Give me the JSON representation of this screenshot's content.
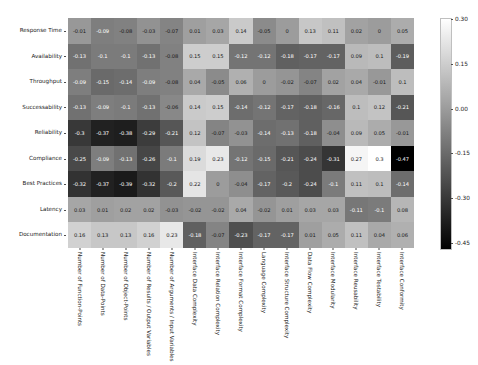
{
  "chart_data": {
    "type": "heatmap",
    "title": "",
    "xlabel": "",
    "ylabel": "",
    "grid": false,
    "legend_position": "right",
    "colormap": "gray",
    "colorbar": {
      "ticks": [
        "0.30",
        "0.15",
        "0.00",
        "-0.15",
        "-0.30",
        "-0.45"
      ],
      "tick_values": [
        0.3,
        0.15,
        0.0,
        -0.15,
        -0.3,
        -0.45
      ],
      "vmin": -0.47,
      "vmax": 0.3
    },
    "row_labels": [
      "Response Time",
      "Availability",
      "Throughput",
      "Successability",
      "Reliability",
      "Compliance",
      "Best Practices",
      "Latency",
      "Documentation"
    ],
    "col_labels": [
      "Number of Function-Points",
      "Number of Data-Points",
      "Number of Object-Points",
      "Number of Results / Output Variables",
      "Number of Arguments / Input Variables",
      "Interface Data Complexity",
      "Interface Relation Complexity",
      "Interface Format Complexity",
      "Language Complexity",
      "Interface Structure Complexity",
      "Data Flow Complexity",
      "Interface Modularity",
      "Interface Reusability",
      "Interface Testability",
      "Interface Conformity"
    ],
    "values": [
      [
        -0.01,
        -0.09,
        -0.08,
        -0.03,
        -0.07,
        0.01,
        0.03,
        0.14,
        -0.05,
        0,
        0.13,
        0.11,
        0.02,
        0,
        0.05
      ],
      [
        -0.13,
        -0.1,
        -0.1,
        -0.13,
        -0.08,
        0.15,
        0.15,
        -0.12,
        -0.12,
        -0.18,
        -0.17,
        -0.17,
        0.09,
        0.1,
        -0.19
      ],
      [
        -0.09,
        -0.15,
        -0.14,
        -0.09,
        -0.08,
        0.04,
        -0.05,
        0.06,
        0,
        -0.02,
        -0.07,
        0.02,
        0.04,
        -0.01,
        0.1
      ],
      [
        -0.13,
        -0.09,
        -0.1,
        -0.13,
        -0.06,
        0.14,
        0.15,
        -0.14,
        -0.12,
        -0.17,
        -0.18,
        -0.16,
        0.1,
        0.12,
        -0.21
      ],
      [
        -0.3,
        -0.37,
        -0.38,
        -0.29,
        -0.21,
        0.12,
        -0.07,
        -0.03,
        -0.14,
        -0.13,
        -0.18,
        -0.04,
        0.09,
        0.05,
        -0.01
      ],
      [
        -0.25,
        -0.09,
        -0.13,
        -0.26,
        -0.1,
        0.19,
        0.23,
        -0.12,
        -0.15,
        -0.21,
        -0.24,
        -0.31,
        0.27,
        0.3,
        -0.47
      ],
      [
        -0.32,
        -0.37,
        -0.39,
        -0.32,
        -0.2,
        0.22,
        0,
        -0.04,
        -0.17,
        -0.2,
        -0.24,
        -0.1,
        0.11,
        0.1,
        -0.14
      ],
      [
        0.03,
        0.01,
        0.02,
        0.02,
        -0.03,
        -0.02,
        -0.02,
        0.04,
        -0.02,
        0.01,
        0.03,
        0.03,
        -0.11,
        -0.1,
        0.08
      ],
      [
        0.16,
        0.13,
        0.13,
        0.16,
        0.23,
        -0.18,
        -0.07,
        -0.23,
        -0.17,
        -0.17,
        0.01,
        0.05,
        0.11,
        0.04,
        0.06
      ]
    ],
    "cell_text": [
      [
        "-0.01",
        "-0.09",
        "-0.08",
        "-0.03",
        "-0.07",
        "0.01",
        "0.03",
        "0.14",
        "-0.05",
        "0",
        "0.13",
        "0.11",
        "0.02",
        "0",
        "0.05"
      ],
      [
        "-0.13",
        "-0.1",
        "-0.1",
        "-0.13",
        "-0.08",
        "0.15",
        "0.15",
        "-0.12",
        "-0.12",
        "-0.18",
        "-0.17",
        "-0.17",
        "0.09",
        "0.1",
        "-0.19"
      ],
      [
        "-0.09",
        "-0.15",
        "-0.14",
        "-0.09",
        "-0.08",
        "0.04",
        "-0.05",
        "0.06",
        "0",
        "-0.02",
        "-0.07",
        "0.02",
        "0.04",
        "-0.01",
        "0.1"
      ],
      [
        "-0.13",
        "-0.09",
        "-0.1",
        "-0.13",
        "-0.06",
        "0.14",
        "0.15",
        "-0.14",
        "-0.12",
        "-0.17",
        "-0.18",
        "-0.16",
        "0.1",
        "0.12",
        "-0.21"
      ],
      [
        "-0.3",
        "-0.37",
        "-0.38",
        "-0.29",
        "-0.21",
        "0.12",
        "-0.07",
        "-0.03",
        "-0.14",
        "-0.13",
        "-0.18",
        "-0.04",
        "0.09",
        "0.05",
        "-0.01"
      ],
      [
        "-0.25",
        "-0.09",
        "-0.13",
        "-0.26",
        "-0.1",
        "0.19",
        "0.23",
        "-0.12",
        "-0.15",
        "-0.21",
        "-0.24",
        "-0.31",
        "0.27",
        "0.3",
        "-0.47"
      ],
      [
        "-0.32",
        "-0.37",
        "-0.39",
        "-0.32",
        "-0.2",
        "0.22",
        "0",
        "-0.04",
        "-0.17",
        "-0.2",
        "-0.24",
        "-0.1",
        "0.11",
        "0.1",
        "-0.14"
      ],
      [
        "0.03",
        "0.01",
        "0.02",
        "0.02",
        "-0.03",
        "-0.02",
        "-0.02",
        "0.04",
        "-0.02",
        "0.01",
        "0.03",
        "0.03",
        "-0.11",
        "-0.1",
        "0.08"
      ],
      [
        "0.16",
        "0.13",
        "0.13",
        "0.16",
        "0.23",
        "-0.18",
        "-0.07",
        "-0.23",
        "-0.17",
        "-0.17",
        "0.01",
        "0.05",
        "0.11",
        "0.04",
        "0.06"
      ]
    ]
  }
}
